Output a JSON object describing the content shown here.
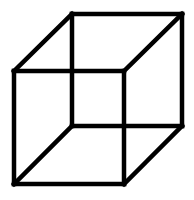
{
  "diagram": {
    "type": "necker-cube",
    "stroke_color": "#000000",
    "background_color": "#ffffff",
    "stroke_width": 4.5,
    "vertices": {
      "front_top_left": [
        14,
        71
      ],
      "front_top_right": [
        124,
        71
      ],
      "front_bottom_left": [
        14,
        184
      ],
      "front_bottom_right": [
        124,
        184
      ],
      "back_top_left": [
        72,
        14
      ],
      "back_top_right": [
        182,
        14
      ],
      "back_bottom_left": [
        72,
        126
      ],
      "back_bottom_right": [
        182,
        126
      ]
    },
    "edges": [
      {
        "name": "front-top-edge",
        "from": "front_top_left",
        "to": "front_top_right"
      },
      {
        "name": "front-bottom-edge",
        "from": "front_bottom_left",
        "to": "front_bottom_right"
      },
      {
        "name": "front-left-edge",
        "from": "front_top_left",
        "to": "front_bottom_left"
      },
      {
        "name": "front-right-edge",
        "from": "front_top_right",
        "to": "front_bottom_right"
      },
      {
        "name": "back-top-edge",
        "from": "back_top_left",
        "to": "back_top_right"
      },
      {
        "name": "back-bottom-edge",
        "from": "back_bottom_left",
        "to": "back_bottom_right"
      },
      {
        "name": "back-left-edge",
        "from": "back_top_left",
        "to": "back_bottom_left"
      },
      {
        "name": "back-right-edge",
        "from": "back_top_right",
        "to": "back_bottom_right"
      },
      {
        "name": "connector-top-left-edge",
        "from": "front_top_left",
        "to": "back_top_left"
      },
      {
        "name": "connector-top-right-edge",
        "from": "front_top_right",
        "to": "back_top_right"
      },
      {
        "name": "connector-bottom-left-edge",
        "from": "front_bottom_left",
        "to": "back_bottom_left"
      },
      {
        "name": "connector-bottom-right-edge",
        "from": "front_bottom_right",
        "to": "back_bottom_right"
      }
    ]
  }
}
